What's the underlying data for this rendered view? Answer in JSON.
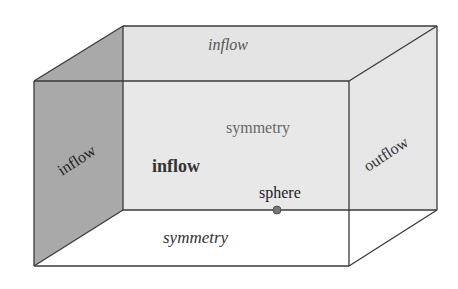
{
  "diagram": {
    "type": "3d-box-boundary-conditions",
    "faces": {
      "top": {
        "label": "inflow",
        "style": "italic",
        "fill": "#e6e6e6"
      },
      "back": {
        "label": "symmetry",
        "style": "normal",
        "fill": "#e8e8e8"
      },
      "left": {
        "label": "inflow",
        "style": "normal",
        "fill": "#a9a9a9"
      },
      "right": {
        "label": "outflow",
        "style": "normal",
        "fill": "#e6e6e6"
      },
      "bottom": {
        "label": "symmetry",
        "style": "italic",
        "fill": "#ffffff"
      },
      "front": {
        "label": "inflow",
        "style": "bold"
      }
    },
    "object": {
      "label": "sphere",
      "color": "#777777"
    },
    "edge_color": "#3a3a3a"
  }
}
